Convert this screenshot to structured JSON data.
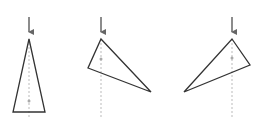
{
  "diagram": {
    "colors": {
      "outline": "#333333",
      "arrow": "#666666",
      "dashed_line": "#bbbbbb",
      "dot": "#aaaaaa",
      "background": "#ffffff"
    },
    "figures": [
      {
        "id": "triangle-1",
        "apex": [
          29,
          39
        ],
        "vertices": [
          [
            29,
            39
          ],
          [
            45,
            112
          ],
          [
            13,
            112
          ]
        ],
        "center_dot": [
          29,
          101
        ],
        "arrow": {
          "x": 29,
          "y_start": 17,
          "y_end": 37
        },
        "dashed_line": {
          "x": 29,
          "y_start": 39,
          "y_end": 118
        }
      },
      {
        "id": "triangle-2",
        "apex": [
          101,
          39
        ],
        "vertices": [
          [
            101,
            39
          ],
          [
            151,
            92
          ],
          [
            88,
            68
          ]
        ],
        "center_dot": [
          101,
          59
        ],
        "arrow": {
          "x": 101,
          "y_start": 17,
          "y_end": 37
        },
        "dashed_line": {
          "x": 101,
          "y_start": 39,
          "y_end": 118
        }
      },
      {
        "id": "triangle-3",
        "apex": [
          232,
          39
        ],
        "vertices": [
          [
            232,
            39
          ],
          [
            250,
            65
          ],
          [
            184,
            92
          ]
        ],
        "center_dot": [
          232,
          58
        ],
        "arrow": {
          "x": 232,
          "y_start": 17,
          "y_end": 37
        },
        "dashed_line": {
          "x": 232,
          "y_start": 39,
          "y_end": 118
        }
      }
    ]
  }
}
